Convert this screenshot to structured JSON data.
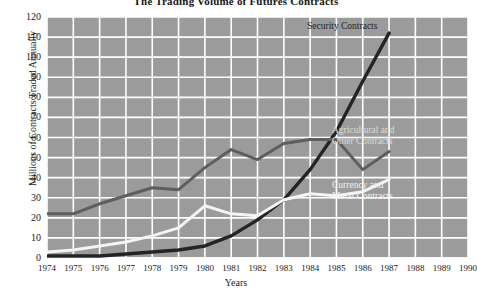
{
  "chart_data": {
    "type": "line",
    "title": "The Trading Volume of Futures Contracts",
    "xlabel": "Years",
    "ylabel": "Millions of Contracts Traded Annually",
    "x": [
      1974,
      1975,
      1976,
      1977,
      1978,
      1979,
      1980,
      1981,
      1982,
      1983,
      1984,
      1985,
      1986,
      1987,
      1988,
      1989,
      1990
    ],
    "categories": [
      "1974",
      "1975",
      "1976",
      "1977",
      "1978",
      "1979",
      "1980",
      "1981",
      "1982",
      "1983",
      "1984",
      "1985",
      "1986",
      "1987",
      "1988",
      "1989",
      "1990"
    ],
    "xlim": [
      1974,
      1990
    ],
    "ylim": [
      0,
      120
    ],
    "yticks": [
      0,
      10,
      20,
      30,
      40,
      50,
      60,
      70,
      80,
      90,
      100,
      110,
      120
    ],
    "grid": true,
    "legend_position": "inline-right",
    "series": [
      {
        "name": "Security Contracts",
        "color": "#242424",
        "x": [
          1974,
          1975,
          1976,
          1977,
          1978,
          1979,
          1980,
          1981,
          1982,
          1983,
          1984,
          1985,
          1986,
          1987
        ],
        "values": [
          1,
          1,
          1,
          2,
          3,
          4,
          6,
          11,
          19,
          29,
          44,
          63,
          88,
          112
        ]
      },
      {
        "name": "Agricultural and Other Contracts",
        "color": "#5e5e5e",
        "x": [
          1974,
          1975,
          1976,
          1977,
          1978,
          1979,
          1980,
          1981,
          1982,
          1983,
          1984,
          1985,
          1986,
          1987
        ],
        "values": [
          22,
          22,
          27,
          31,
          35,
          34,
          45,
          54,
          49,
          57,
          59,
          59,
          44,
          53
        ]
      },
      {
        "name": "Currency and Metal Contracts",
        "color": "#f4f4f4",
        "x": [
          1974,
          1975,
          1976,
          1977,
          1978,
          1979,
          1980,
          1981,
          1982,
          1983,
          1984,
          1985,
          1986,
          1987
        ],
        "values": [
          3,
          4,
          6,
          8,
          11,
          15,
          26,
          22,
          21,
          29,
          32,
          31,
          33,
          39
        ]
      }
    ],
    "annotations": [
      {
        "name": "security-label",
        "text": "Security Contracts"
      },
      {
        "name": "agricultural-label",
        "text": "Agricultural and\nOther Contracts"
      },
      {
        "name": "currency-label",
        "text": "Currency and\nMetal Contracts"
      }
    ]
  },
  "labels": {
    "security": "Security Contracts",
    "agricultural_line1": "Agricultural and",
    "agricultural_line2": "Other Contracts",
    "currency_line1": "Currency and",
    "currency_line2": "Metal Contracts"
  },
  "colors": {
    "plot_background": "#9b9b9b",
    "gridline": "#ffffff",
    "security": "#242424",
    "agricultural": "#5e5e5e",
    "currency": "#f4f4f4",
    "page_background": "#ffffff",
    "text": "#1a1a1a"
  }
}
